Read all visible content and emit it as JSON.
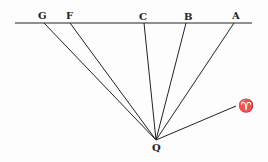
{
  "diagram": {
    "horizontal_line": {
      "x1": 15,
      "y1": 23,
      "x2": 252,
      "y2": 23
    },
    "vertex": {
      "label": "Q",
      "x": 156,
      "y": 140
    },
    "points": [
      {
        "label": "G",
        "x": 44,
        "y": 23
      },
      {
        "label": "F",
        "x": 70,
        "y": 23
      },
      {
        "label": "C",
        "x": 144,
        "y": 23
      },
      {
        "label": "B",
        "x": 186,
        "y": 23
      },
      {
        "label": "A",
        "x": 234,
        "y": 23
      }
    ],
    "aries": {
      "label": "♈",
      "x": 237,
      "y": 106
    },
    "stroke_color": "#222222"
  }
}
